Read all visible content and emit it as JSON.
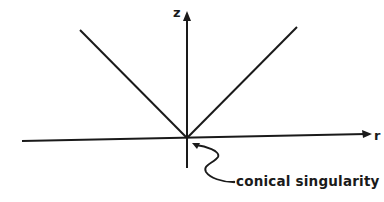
{
  "diagram": {
    "axes": {
      "vertical": {
        "label": "z"
      },
      "horizontal": {
        "label": "r"
      }
    },
    "annotation": {
      "label": "conical singularity"
    },
    "colors": {
      "ink": "#1a1a1a",
      "background": "#ffffff"
    }
  }
}
